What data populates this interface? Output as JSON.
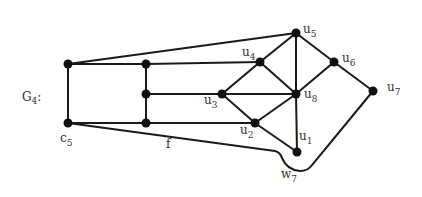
{
  "diagram": {
    "graph_name": "G",
    "graph_name_sub": "4",
    "graph_name_suffix": ":",
    "labels": {
      "u1": {
        "base": "u",
        "sub": "1"
      },
      "u2": {
        "base": "u",
        "sub": "2"
      },
      "u3": {
        "base": "u",
        "sub": "3"
      },
      "u4": {
        "base": "u",
        "sub": "4"
      },
      "u5": {
        "base": "u",
        "sub": "5"
      },
      "u6": {
        "base": "u",
        "sub": "6"
      },
      "u7": {
        "base": "u",
        "sub": "7"
      },
      "u8": {
        "base": "u",
        "sub": "8"
      },
      "c5": {
        "base": "c",
        "sub": "5"
      },
      "w7": {
        "base": "w",
        "sub": "7"
      },
      "f": {
        "base": "f"
      }
    },
    "nodes": [
      {
        "id": "a",
        "x": 68,
        "y": 64
      },
      {
        "id": "c5",
        "x": 68,
        "y": 123
      },
      {
        "id": "b1",
        "x": 146,
        "y": 64
      },
      {
        "id": "b2",
        "x": 146,
        "y": 94
      },
      {
        "id": "b3",
        "x": 146,
        "y": 123
      },
      {
        "id": "u1",
        "x": 297,
        "y": 152
      },
      {
        "id": "u2",
        "x": 255,
        "y": 123
      },
      {
        "id": "u3",
        "x": 222,
        "y": 94
      },
      {
        "id": "u4",
        "x": 260,
        "y": 62
      },
      {
        "id": "u5",
        "x": 296,
        "y": 33
      },
      {
        "id": "u6",
        "x": 334,
        "y": 62
      },
      {
        "id": "u7",
        "x": 373,
        "y": 91
      },
      {
        "id": "u8",
        "x": 296,
        "y": 94
      }
    ],
    "edges": [
      [
        "a",
        "u5"
      ],
      [
        "a",
        "c5"
      ],
      [
        "a",
        "b1"
      ],
      [
        "b1",
        "u4"
      ],
      [
        "b1",
        "b2"
      ],
      [
        "b2",
        "b3"
      ],
      [
        "b2",
        "u3"
      ],
      [
        "c5",
        "b3"
      ],
      [
        "b3",
        "u2"
      ],
      [
        "u3",
        "u4"
      ],
      [
        "u3",
        "u8"
      ],
      [
        "u3",
        "u2"
      ],
      [
        "u4",
        "u5"
      ],
      [
        "u4",
        "u8"
      ],
      [
        "u5",
        "u8"
      ],
      [
        "u5",
        "u6"
      ],
      [
        "u6",
        "u8"
      ],
      [
        "u6",
        "u7"
      ],
      [
        "u2",
        "u8"
      ],
      [
        "u2",
        "u1"
      ],
      [
        "u8",
        "u1"
      ]
    ]
  }
}
